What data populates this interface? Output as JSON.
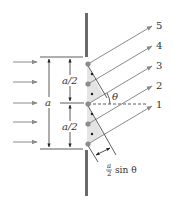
{
  "diagram": {
    "colors": {
      "barrier": "#6a6a6a",
      "ray": "#8a8a8a",
      "dim_line": "#333333",
      "source_large": "#8c8c8c",
      "source_small": "#1a1a1a",
      "shade": "#e4e4e4"
    },
    "labels": {
      "slit_width": "a",
      "half_width_upper": "a/2",
      "half_width_lower": "a/2",
      "angle": "θ",
      "path_diff_frac_num": "a",
      "path_diff_frac_den": "2",
      "path_diff_rest": "sin θ",
      "ray_5": "5",
      "ray_4": "4",
      "ray_3": "3",
      "ray_2": "2",
      "ray_1": "1"
    },
    "incoming_waves": {
      "count": 5
    },
    "sources": {
      "large_count": 5,
      "small_count": 4
    },
    "rays": [
      "5",
      "4",
      "3",
      "2",
      "1"
    ]
  }
}
